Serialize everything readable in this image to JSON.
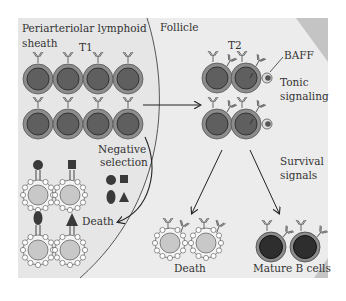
{
  "diagram": {
    "regions": {
      "pals": "Periarteriolar lymphoid",
      "pals_line2": "sheath",
      "follicle": "Follicle"
    },
    "stages": {
      "t1": "T1",
      "t2": "T2"
    },
    "labels": {
      "baff": "BAFF",
      "tonic_1": "Tonic",
      "tonic_2": "signaling",
      "negsel_1": "Negative",
      "negsel_2": "selection",
      "death_left": "Death",
      "survival_1": "Survival",
      "survival_2": "signals",
      "death_bottom": "Death",
      "mature": "Mature B cells"
    },
    "colors": {
      "panel_bg": "#e6e6e6",
      "follicle_bg": "#ececec",
      "cell_outer": "#8c8c8c",
      "cell_nucleus": "#5f5f5f",
      "mature_nucleus": "#2e2e2e",
      "apoptotic_fill": "#c8c8c8",
      "antigen": "#3a3a3a",
      "corner_wedge": "#c4c4c4"
    }
  }
}
